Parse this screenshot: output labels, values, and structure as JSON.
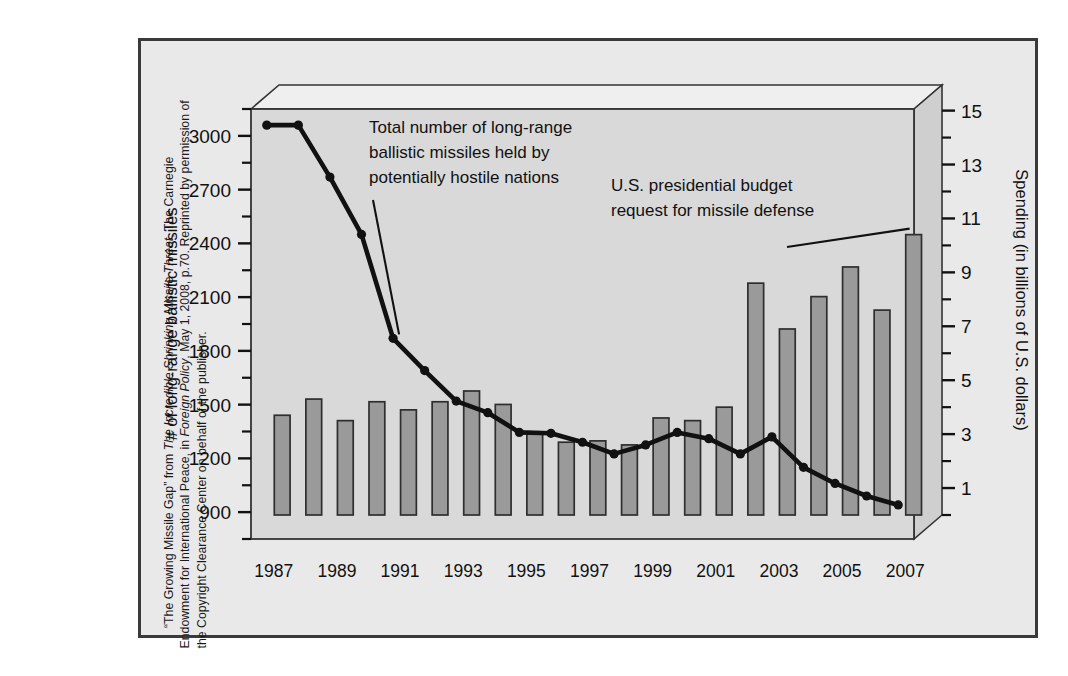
{
  "figure": {
    "credit_line1": "“The Growing Missile Gap” from ",
    "credit_italic1": "The Incredible Shrinking Missile Threat",
    "credit_line2": ", The Carnegie Endowment for International Peace, in ",
    "credit_italic2": "Foreign Policy",
    "credit_line3": ", May 1, 2008, p.70. Reprinted by permission of the Copyright Clearance Center on behalf of the publisher."
  },
  "chart_data": {
    "type": "bar",
    "title": "",
    "xlabel": "",
    "ylabel": "# of long-range ballistic missiles",
    "y2label": "Spending (in billions of U.S. dollars)",
    "categories": [
      1987,
      1988,
      1989,
      1990,
      1991,
      1992,
      1993,
      1994,
      1995,
      1996,
      1997,
      1998,
      1999,
      2000,
      2001,
      2002,
      2003,
      2004,
      2005,
      2006,
      2007
    ],
    "xtick_labels": [
      "1987",
      "1989",
      "1991",
      "1993",
      "1995",
      "1997",
      "1999",
      "2001",
      "2003",
      "2005",
      "2007"
    ],
    "xticks": [
      1987,
      1989,
      1991,
      1993,
      1995,
      1997,
      1999,
      2001,
      2003,
      2005,
      2007
    ],
    "ylim": [
      750,
      3150
    ],
    "yticks": [
      900,
      1200,
      1500,
      1800,
      2100,
      2400,
      2700,
      3000
    ],
    "ytick_labels": [
      "900",
      "1200",
      "1500",
      "1800",
      "2100",
      "2400",
      "2700",
      "3000"
    ],
    "y2lim": [
      0.0,
      15.95
    ],
    "y2ticks": [
      1,
      3,
      5,
      7,
      9,
      11,
      13,
      15
    ],
    "y2tick_labels": [
      "1",
      "3",
      "5",
      "7",
      "9",
      "11",
      "13",
      "15"
    ],
    "y2_minor_step": 1,
    "grid": false,
    "legend": "none",
    "series": [
      {
        "name": "U.S. presidential budget request for missile defense",
        "type": "bar",
        "axis": "right",
        "unit": "billions of U.S. dollars",
        "color": "#9a9a9a",
        "edge_color": "#2e2e2e",
        "values": [
          3.7,
          4.3,
          3.5,
          4.2,
          3.9,
          4.2,
          4.6,
          4.1,
          3.0,
          2.7,
          2.75,
          2.6,
          3.6,
          3.5,
          4.0,
          8.6,
          6.9,
          8.1,
          9.2,
          7.6,
          10.4
        ]
      },
      {
        "name": "Total number of long-range ballistic missiles held by potentially hostile nations",
        "type": "line",
        "axis": "left",
        "unit": "missiles",
        "color": "#111111",
        "marker": "circle",
        "values": [
          3060,
          3060,
          2770,
          2450,
          1870,
          1690,
          1520,
          1455,
          1345,
          1340,
          1290,
          1225,
          1275,
          1345,
          1310,
          1225,
          1320,
          1150,
          1060,
          990,
          940
        ]
      }
    ],
    "annotations": [
      {
        "id": "line-annotation",
        "text_lines": [
          "Total number of long-range",
          "ballistic missiles held by",
          "potentially hostile nations"
        ],
        "points_to_year": 1991
      },
      {
        "id": "bar-annotation",
        "text_lines": [
          "U.S. presidential budget",
          "request for missile defense"
        ],
        "points_to_year": 2007
      }
    ]
  },
  "colors": {
    "frame_border": "#3a3a3a",
    "figure_background": "#e9e9e9",
    "plot_background": "#d9d9d9",
    "plot_top_face": "#efefef",
    "plot_side_face": "#cfcfcf",
    "bar_fill": "#9a9a9a",
    "bar_edge": "#2e2e2e",
    "line_color": "#111111",
    "text": "#111111"
  }
}
